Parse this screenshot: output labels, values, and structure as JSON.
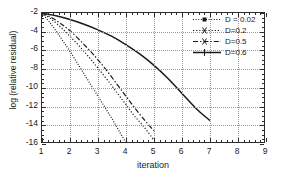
{
  "chart_data": {
    "type": "line",
    "title": "",
    "xlabel": "iteration",
    "ylabel": "log (relative residual)",
    "xlim": [
      1,
      9
    ],
    "ylim": [
      -16,
      -2
    ],
    "grid": true,
    "legend_position": "upper right",
    "xticks": [
      1,
      2,
      3,
      4,
      5,
      6,
      7,
      8,
      9
    ],
    "yticks": [
      -2,
      -4,
      -6,
      -8,
      -10,
      -12,
      -14,
      -16
    ],
    "series": [
      {
        "name": "D = 0.02",
        "style": "dotted-marker",
        "x": [
          1.0,
          1.25,
          1.5,
          1.75,
          2.0,
          2.25,
          2.5,
          2.75,
          3.0,
          3.25,
          3.5,
          3.75,
          4.0
        ],
        "y": [
          -2.0,
          -2.9,
          -3.9,
          -5.0,
          -6.1,
          -7.3,
          -8.5,
          -9.7,
          -10.9,
          -12.1,
          -13.3,
          -14.6,
          -15.9
        ]
      },
      {
        "name": "D=0.2",
        "style": "dotted-x",
        "x": [
          1.0,
          1.35,
          1.7,
          2.0,
          2.35,
          2.7,
          3.0,
          3.35,
          3.7,
          4.0,
          4.3,
          4.65,
          5.0
        ],
        "y": [
          -2.0,
          -2.7,
          -3.6,
          -4.5,
          -5.6,
          -6.8,
          -7.9,
          -9.2,
          -10.6,
          -11.8,
          -13.0,
          -14.2,
          -15.6
        ]
      },
      {
        "name": "D=0.5",
        "style": "dash-dot",
        "x": [
          1.0,
          1.35,
          1.7,
          2.0,
          2.35,
          2.7,
          3.0,
          3.35,
          3.7,
          4.0,
          4.3,
          4.65,
          5.0
        ],
        "y": [
          -2.0,
          -2.5,
          -3.2,
          -3.9,
          -4.9,
          -6.0,
          -7.0,
          -8.3,
          -9.7,
          -10.9,
          -12.1,
          -13.4,
          -14.6
        ]
      },
      {
        "name": "D=0.6",
        "style": "solid-plus",
        "x": [
          1.0,
          1.5,
          2.0,
          2.5,
          3.0,
          3.5,
          4.0,
          4.5,
          5.0,
          5.5,
          6.0,
          6.5,
          7.0
        ],
        "y": [
          -2.0,
          -2.3,
          -2.7,
          -3.2,
          -3.8,
          -4.5,
          -5.4,
          -6.4,
          -7.6,
          -9.0,
          -10.6,
          -12.2,
          -13.5
        ]
      }
    ]
  },
  "axes": {
    "xlabel": "iteration",
    "ylabel": "log (relative residual)",
    "xtick_labels": [
      "1",
      "2",
      "3",
      "4",
      "5",
      "6",
      "7",
      "8",
      "9"
    ],
    "ytick_labels": [
      "-2",
      "-4",
      "-6",
      "-8",
      "-10",
      "-12",
      "-14",
      "-16"
    ]
  },
  "legend": {
    "entries": [
      {
        "label": "D = 0.02"
      },
      {
        "label": "D=0.2"
      },
      {
        "label": "D=0.5"
      },
      {
        "label": "D=0.6"
      }
    ]
  },
  "colors": {
    "axis": "#2b2b2b",
    "grid": "#9a9a9a",
    "curve": "#1a1a1a",
    "background": "#ffffff"
  }
}
